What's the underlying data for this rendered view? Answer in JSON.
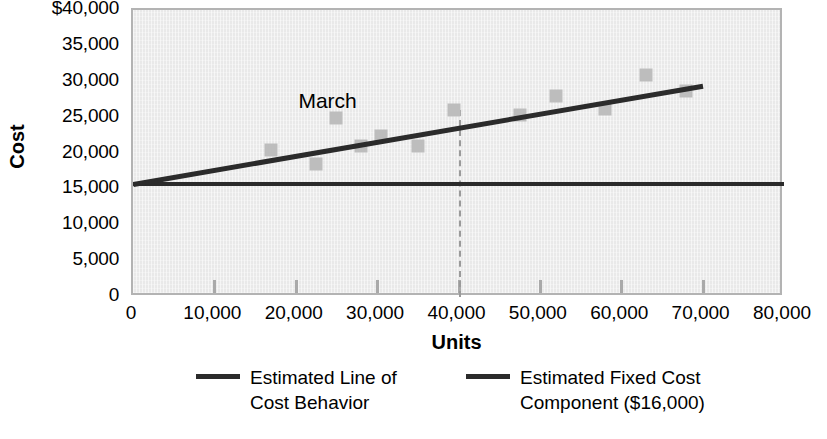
{
  "chart_data": {
    "type": "scatter",
    "title": "",
    "xlabel": "Units",
    "ylabel": "Cost",
    "xlim": [
      0,
      80000
    ],
    "ylim": [
      0,
      40000
    ],
    "grid": false,
    "legend_position": "bottom",
    "x_ticks": [
      {
        "value": 0,
        "label": "0"
      },
      {
        "value": 10000,
        "label": "10,000"
      },
      {
        "value": 20000,
        "label": "20,000"
      },
      {
        "value": 30000,
        "label": "30,000"
      },
      {
        "value": 40000,
        "label": "40,000"
      },
      {
        "value": 50000,
        "label": "50,000"
      },
      {
        "value": 60000,
        "label": "60,000"
      },
      {
        "value": 70000,
        "label": "70,000"
      },
      {
        "value": 80000,
        "label": "80,000"
      }
    ],
    "y_ticks": [
      {
        "value": 40000,
        "label": "$40,000"
      },
      {
        "value": 35000,
        "label": "35,000"
      },
      {
        "value": 30000,
        "label": "30,000"
      },
      {
        "value": 25000,
        "label": "25,000"
      },
      {
        "value": 20000,
        "label": "20,000"
      },
      {
        "value": 15000,
        "label": "15,000"
      },
      {
        "value": 10000,
        "label": "10,000"
      },
      {
        "value": 5000,
        "label": "5,000"
      },
      {
        "value": 0,
        "label": "0"
      }
    ],
    "series": [
      {
        "name": "Observed monthly cost",
        "type": "scatter",
        "marker": "square",
        "color": "#bdbdbd",
        "points": [
          {
            "x": 17000,
            "y": 20500
          },
          {
            "x": 22500,
            "y": 18500
          },
          {
            "x": 25000,
            "y": 25000
          },
          {
            "x": 28000,
            "y": 21000
          },
          {
            "x": 30500,
            "y": 22500
          },
          {
            "x": 35000,
            "y": 21000
          },
          {
            "x": 39500,
            "y": 26000
          },
          {
            "x": 47500,
            "y": 25300
          },
          {
            "x": 52000,
            "y": 28000
          },
          {
            "x": 58000,
            "y": 26200
          },
          {
            "x": 63000,
            "y": 31000
          },
          {
            "x": 68000,
            "y": 28700
          }
        ]
      },
      {
        "name": "Estimated Line of Cost Behavior",
        "type": "line",
        "color": "#2b2b2b",
        "x": [
          0,
          70000
        ],
        "y": [
          16000,
          29700
        ]
      },
      {
        "name": "Estimated Fixed Cost Component ($16,000)",
        "type": "line",
        "color": "#2b2b2b",
        "x": [
          0,
          80000
        ],
        "y": [
          16000,
          16000
        ]
      }
    ],
    "annotations": [
      {
        "text": "March",
        "x": 25000,
        "y": 27400,
        "points_to": {
          "x": 25000,
          "y": 25000
        }
      }
    ],
    "reference_lines": [
      {
        "axis": "x",
        "value": 40000,
        "style": "dashed",
        "color": "#9a9a9a",
        "from_y": 0,
        "to_y": 26000
      }
    ]
  },
  "legend": [
    {
      "label": "Estimated Line of\nCost Behavior",
      "color": "#2b2b2b"
    },
    {
      "label": "Estimated Fixed Cost\nComponent ($16,000)",
      "color": "#2b2b2b"
    }
  ],
  "axis_titles": {
    "x": "Units",
    "y": "Cost"
  },
  "annotation_text": "March"
}
